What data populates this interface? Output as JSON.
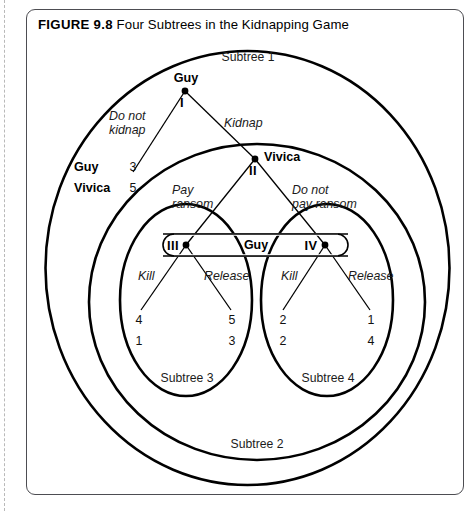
{
  "figure": {
    "label": "FIGURE 9.8",
    "title": "Four Subtrees in the Kidnapping Game"
  },
  "diagram": {
    "type": "extensive-form-game-tree",
    "subtrees": [
      {
        "id": "subtree-1",
        "label": "Subtree 1"
      },
      {
        "id": "subtree-2",
        "label": "Subtree 2"
      },
      {
        "id": "subtree-3",
        "label": "Subtree 3"
      },
      {
        "id": "subtree-4",
        "label": "Subtree 4"
      }
    ],
    "nodes": [
      {
        "id": "node-1",
        "numeral": "I",
        "player": "Guy"
      },
      {
        "id": "node-2",
        "numeral": "II",
        "player": "Vivica"
      },
      {
        "id": "node-3",
        "numeral": "III",
        "player": "Guy"
      },
      {
        "id": "node-4",
        "numeral": "IV",
        "player": "Guy"
      }
    ],
    "information_set": {
      "label": "Guy"
    },
    "actions": {
      "do_not_kidnap": "Do not\nkidnap",
      "do_not_kidnap_line1": "Do not",
      "do_not_kidnap_line2": "kidnap",
      "kidnap": "Kidnap",
      "pay_ransom_line1": "Pay",
      "pay_ransom_line2": "ransom",
      "do_not_pay_line1": "Do not",
      "do_not_pay_line2": "pay ransom",
      "kill_left": "Kill",
      "release_left": "Release",
      "kill_right": "Kill",
      "release_right": "Release"
    },
    "payoff_legend": {
      "player_1": "Guy",
      "player_2": "Vivica"
    },
    "payoffs": [
      {
        "id": "payoff-do-not-kidnap",
        "guy": "3",
        "vivica": "5"
      },
      {
        "id": "payoff-kill-left",
        "guy": "4",
        "vivica": "1"
      },
      {
        "id": "payoff-release-left",
        "guy": "5",
        "vivica": "3"
      },
      {
        "id": "payoff-kill-right",
        "guy": "2",
        "vivica": "2"
      },
      {
        "id": "payoff-release-right",
        "guy": "1",
        "vivica": "4"
      }
    ],
    "colors": {
      "ink": "#000000",
      "border": "#4d4d52",
      "margin_rule": "#b9b9b9"
    }
  }
}
